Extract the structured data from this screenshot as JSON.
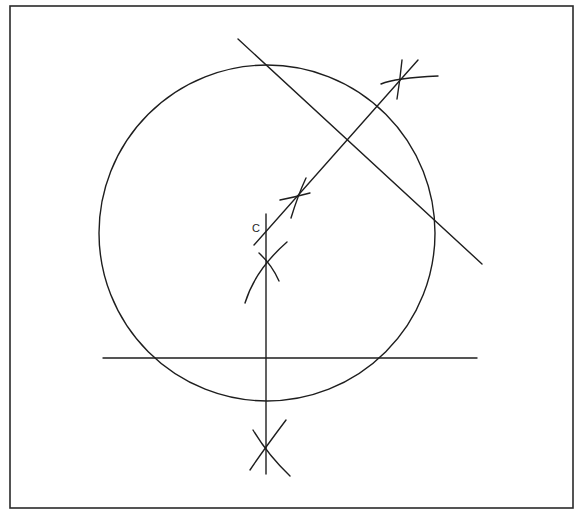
{
  "diagram": {
    "type": "geometric-construction",
    "colors": {
      "background": "#ffffff",
      "ink": "#1e1e1e",
      "frame": "#2a2a2a"
    },
    "frame": {
      "x": 10,
      "y": 6,
      "width": 563,
      "height": 502
    },
    "circle": {
      "cx": 267,
      "cy": 233,
      "r": 168
    },
    "center_label": {
      "text": "C",
      "x": 252,
      "y": 232
    },
    "lines": [
      {
        "name": "horizontal-chord",
        "x1": 103,
        "y1": 358,
        "x2": 477,
        "y2": 358
      },
      {
        "name": "vertical-bisector",
        "x1": 266,
        "y1": 214,
        "x2": 266,
        "y2": 474
      },
      {
        "name": "diagonal-chord",
        "x1": 238,
        "y1": 39,
        "x2": 482,
        "y2": 264
      },
      {
        "name": "diagonal-bisector",
        "x1": 254,
        "y1": 245,
        "x2": 418,
        "y2": 60
      }
    ],
    "construction_arcs": [
      {
        "name": "arc-lower-left",
        "d": "M 250 470 Q 262 452 286 420"
      },
      {
        "name": "arc-lower-right",
        "d": "M 253 430 Q 268 455 290 476"
      },
      {
        "name": "arc-upper-vert-left",
        "d": "M 245 303 Q 255 270 287 242"
      },
      {
        "name": "arc-upper-vert-right",
        "d": "M 259 253 Q 272 265 279 281"
      },
      {
        "name": "arc-diag-upper-a",
        "d": "M 291 218 Q 298 195 306 178"
      },
      {
        "name": "arc-diag-upper-b",
        "d": "M 280 200 Q 295 197 310 193"
      },
      {
        "name": "arc-diag-top-a",
        "d": "M 381 84 Q 395 78 438 76"
      },
      {
        "name": "arc-diag-top-b",
        "d": "M 402 60 Q 400 80 397 99"
      }
    ]
  }
}
